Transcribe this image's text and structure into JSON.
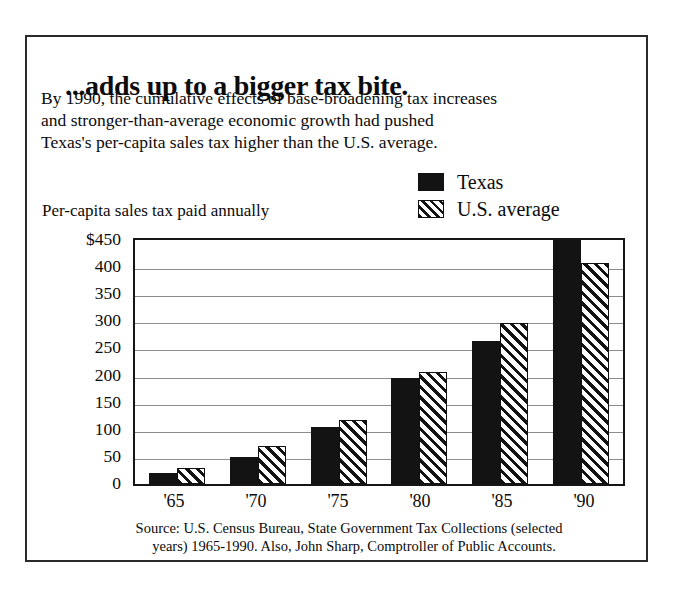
{
  "headline": "...adds up to a bigger tax bite.",
  "deck": [
    "By 1990, the cumulative effects of base-broadening tax increases",
    "and stronger-than-average economic growth had pushed",
    "Texas's per-capita sales tax higher than the U.S. average."
  ],
  "legend": {
    "items": [
      {
        "label": "Texas",
        "swatch": "solid-black-swatch",
        "color": "#131313"
      },
      {
        "label": "U.S. average",
        "swatch": "diagonal-hatch-swatch",
        "color": "#131313"
      }
    ]
  },
  "source_note": {
    "line1": "Source:  U.S. Census Bureau, State Government Tax Collections (selected",
    "line2": "years) 1965-1990. Also, John Sharp, Comptroller of Public Accounts."
  },
  "chart_data": {
    "type": "bar",
    "title": "...adds up to a bigger tax bite.",
    "ylabel": "Per-capita sales tax paid annually",
    "xlabel": "",
    "categories": [
      "'65",
      "'70",
      "'75",
      "'80",
      "'85",
      "'90"
    ],
    "series": [
      {
        "name": "Texas",
        "values": [
          20,
          50,
          105,
          195,
          263,
          455
        ]
      },
      {
        "name": "U.S. average",
        "values": [
          30,
          70,
          118,
          207,
          297,
          408
        ]
      }
    ],
    "ylim": [
      0,
      450
    ],
    "ytick_labels": [
      "$450",
      "400",
      "350",
      "300",
      "250",
      "200",
      "150",
      "100",
      "50",
      "0"
    ],
    "ytick_values": [
      450,
      400,
      350,
      300,
      250,
      200,
      150,
      100,
      50,
      0
    ],
    "grid": true,
    "legend_position": "top-right"
  }
}
